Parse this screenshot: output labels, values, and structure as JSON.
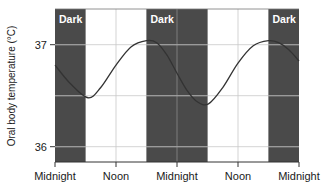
{
  "chart_data": {
    "type": "line",
    "title": "",
    "xlabel": "",
    "ylabel": "Oral body temperature (°C)",
    "x_tick_labels": [
      "Midnight",
      "Noon",
      "Midnight",
      "Noon",
      "Midnight"
    ],
    "x_ticks_hours": [
      0,
      12,
      24,
      36,
      48
    ],
    "y_tick_labels": [
      "36",
      "37"
    ],
    "y_ticks": [
      36,
      37
    ],
    "ylim": [
      35.85,
      37.35
    ],
    "xlim": [
      0,
      48
    ],
    "grid": true,
    "legend": null,
    "dark_bands": [
      {
        "label": "Dark",
        "start_hour": 0,
        "end_hour": 6
      },
      {
        "label": "Dark",
        "start_hour": 18,
        "end_hour": 30
      },
      {
        "label": "Dark",
        "start_hour": 42,
        "end_hour": 48
      }
    ],
    "series": [
      {
        "name": "Oral body temperature",
        "x_hours": [
          0,
          3,
          6.5,
          9,
          12,
          15,
          18,
          20,
          22,
          24,
          26,
          28,
          30.2,
          33,
          36,
          39,
          42,
          44,
          46,
          48
        ],
        "values": [
          36.8,
          36.62,
          36.48,
          36.58,
          36.8,
          36.98,
          37.04,
          37.02,
          36.9,
          36.72,
          36.55,
          36.44,
          36.42,
          36.58,
          36.82,
          36.99,
          37.04,
          37.02,
          36.95,
          36.84
        ]
      }
    ]
  },
  "colors": {
    "dark_band": "#4a4a4a",
    "grid_on_light": "#c8c8c8",
    "grid_on_dark": "#8a8a8a",
    "curve": "#333333",
    "axis": "#333333"
  }
}
